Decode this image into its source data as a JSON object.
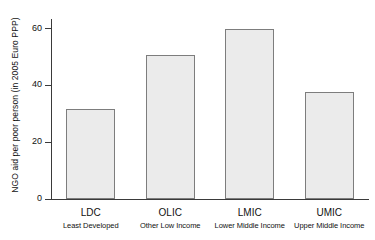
{
  "chart_data": {
    "type": "bar",
    "title": "",
    "xlabel": "",
    "ylabel": "NGO aid per poor person (in 2005 Euro PPP)",
    "categories": [
      "LDC",
      "OLIC",
      "LMIC",
      "UMIC"
    ],
    "category_descriptions": [
      "Least Developed",
      "Other Low Income",
      "Lower Middle Income",
      "Upper Middle Income"
    ],
    "values": [
      31.7,
      50.8,
      60.0,
      37.5
    ],
    "ylim": [
      0,
      63
    ],
    "yticks": [
      0,
      20,
      40,
      60
    ],
    "ytick_labels": [
      "0",
      "20",
      "40",
      "60"
    ],
    "grid": false,
    "legend": null,
    "colors": {
      "bar_fill": "#ebebeb",
      "bar_border": "#7d7d7d",
      "axis": "#3a3a3a",
      "text": "#111111",
      "background": "#ffffff"
    }
  }
}
